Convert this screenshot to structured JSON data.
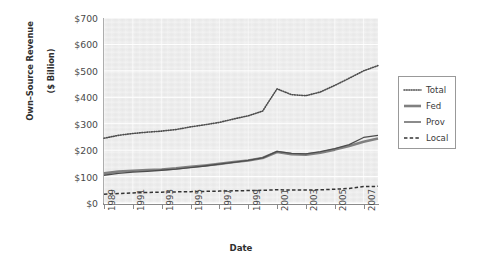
{
  "chart_data": {
    "type": "line",
    "title": "",
    "xlabel": "Date",
    "ylabel": "Own–Source Revenue ($ Billion)",
    "ylabel_line1": "Own–Source Revenue",
    "ylabel_line2": "($ Billion)",
    "grid": true,
    "legend_position": "right",
    "xlim": [
      1989,
      2008
    ],
    "ylim": [
      0,
      700
    ],
    "ytick_labels": [
      "$0",
      "$100",
      "$200",
      "$300",
      "$400",
      "$500",
      "$600",
      "$700"
    ],
    "ytick_values": [
      0,
      100,
      200,
      300,
      400,
      500,
      600,
      700
    ],
    "xtick_labels": [
      "1989",
      "1991",
      "1993",
      "1995",
      "1997",
      "1999",
      "2001",
      "2003",
      "2005",
      "2007"
    ],
    "xtick_values": [
      1989,
      1991,
      1993,
      1995,
      1997,
      1999,
      2001,
      2003,
      2005,
      2007
    ],
    "x": [
      1989,
      1990,
      1991,
      1992,
      1993,
      1994,
      1995,
      1996,
      1997,
      1998,
      1999,
      2000,
      2001,
      2002,
      2003,
      2004,
      2005,
      2006,
      2007,
      2008
    ],
    "series": [
      {
        "name": "Total",
        "style": "dotted",
        "color": "#4d4d4d",
        "width": 1.6,
        "values": [
          245,
          256,
          263,
          268,
          272,
          278,
          288,
          296,
          305,
          318,
          330,
          348,
          432,
          410,
          406,
          420,
          445,
          472,
          500,
          520
        ]
      },
      {
        "name": "Fed",
        "style": "solid-thick",
        "color": "#808080",
        "width": 2.6,
        "values": [
          112,
          119,
          122,
          125,
          127,
          131,
          137,
          142,
          148,
          155,
          161,
          170,
          193,
          185,
          183,
          190,
          202,
          216,
          232,
          244
        ]
      },
      {
        "name": "Prov",
        "style": "solid-thin",
        "color": "#4d4d4d",
        "width": 1.3,
        "values": [
          105,
          112,
          117,
          120,
          124,
          128,
          134,
          140,
          147,
          154,
          161,
          171,
          195,
          188,
          186,
          194,
          206,
          221,
          248,
          256
        ]
      },
      {
        "name": "Local",
        "style": "dashed",
        "color": "#333333",
        "width": 1.5,
        "values": [
          33,
          36,
          38,
          40,
          41,
          42,
          43,
          44,
          45,
          46,
          47,
          48,
          50,
          49,
          49,
          50,
          52,
          55,
          62,
          63
        ]
      }
    ],
    "legend": [
      {
        "label": "Total",
        "style": "dotted"
      },
      {
        "label": "Fed",
        "style": "solid-thick"
      },
      {
        "label": "Prov",
        "style": "solid-thin"
      },
      {
        "label": "Local",
        "style": "dashed"
      }
    ],
    "colors": {
      "panel_background": "#ededed",
      "page_background": "#ffffff",
      "gridline": "#ffffff",
      "axis": "#8b8b8b",
      "text": "#3a3a3a"
    }
  }
}
